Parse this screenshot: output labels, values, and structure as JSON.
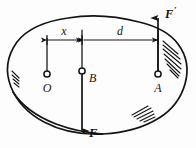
{
  "figure": {
    "background_color": "#fdfdfd",
    "ink_color": "#141414",
    "body_label": "rigid-body-outline",
    "labels": {
      "point_o": "O",
      "point_b": "B",
      "point_a": "A",
      "dimension_x": "x",
      "dimension_d": "d",
      "force_down": "F",
      "force_up": "F",
      "force_up_prime": "′"
    },
    "points": [
      {
        "name": "O",
        "label": "O",
        "x": 47,
        "y": 74
      },
      {
        "name": "B",
        "label": "B",
        "x": 82,
        "y": 71
      },
      {
        "name": "A",
        "label": "A",
        "x": 158,
        "y": 74
      }
    ],
    "forces": [
      {
        "name": "F-prime-up",
        "label": "F",
        "prime": "′",
        "direction": "up",
        "at_point": "A",
        "from_y": 74,
        "to_y": 16
      },
      {
        "name": "F-down",
        "label": "F",
        "prime": "",
        "direction": "down",
        "at_point": "B",
        "from_y": 71,
        "to_y": 133
      }
    ],
    "dimensions": [
      {
        "name": "x",
        "label": "x",
        "from_point": "O",
        "to_point": "B",
        "x1": 47,
        "x2": 82,
        "y": 40
      },
      {
        "name": "d",
        "label": "d",
        "from_point": "B",
        "to_point": "A",
        "x1": 82,
        "x2": 158,
        "y": 40
      }
    ],
    "hatch_groups": [
      {
        "name": "hatch-left",
        "count": 4
      },
      {
        "name": "hatch-right",
        "count": 7
      },
      {
        "name": "hatch-bottom-right",
        "count": 5
      }
    ]
  }
}
